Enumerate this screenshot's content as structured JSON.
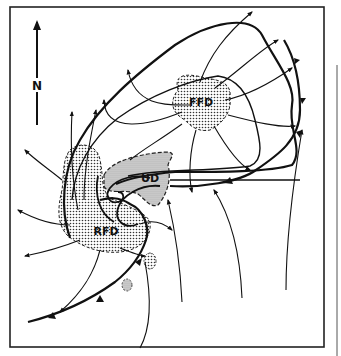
{
  "diagram": {
    "type": "supercell-thunderstorm-plan-view",
    "labels": {
      "north": "N",
      "forward_flank_downdraft": "FFD",
      "updraft": "UD",
      "rear_flank_downdraft": "RFD"
    },
    "colors": {
      "ink": "#111111",
      "background": "#ffffff",
      "stipple": "#333333",
      "shade": "#c8c8c8"
    }
  }
}
